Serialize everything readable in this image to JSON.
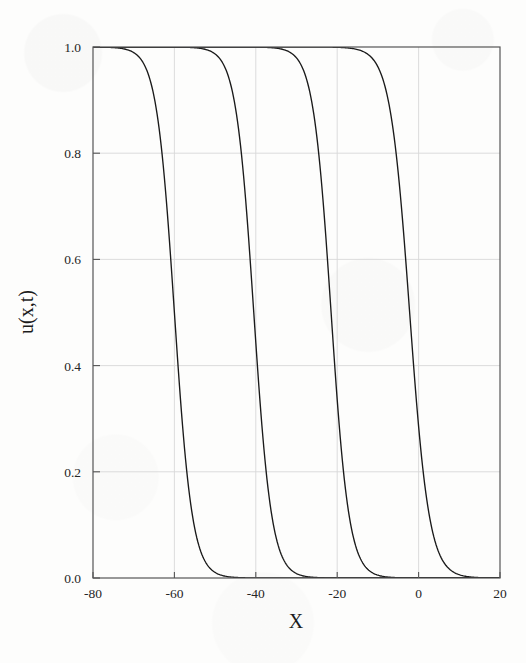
{
  "figure": {
    "background_color": "#fdfdfc",
    "frame_color": "#555555",
    "grid_color": "#d8d8d8",
    "curve_color": "#1a1a1a"
  },
  "axes": {
    "x_title": "X",
    "y_title": "u(x,t)",
    "x_ticks": [
      "-80",
      "-60",
      "-40",
      "-20",
      "0",
      "20"
    ],
    "y_ticks": [
      "0.0",
      "0.2",
      "0.4",
      "0.6",
      "0.8",
      "1.0"
    ]
  },
  "chart_data": {
    "type": "line",
    "title": "",
    "subtitle": "",
    "xlabel": "X",
    "ylabel": "u(x,t)",
    "xlim": [
      -80,
      20
    ],
    "ylim": [
      0.0,
      1.0
    ],
    "xticks": [
      -80,
      -60,
      -40,
      -20,
      0,
      20
    ],
    "yticks": [
      0.0,
      0.2,
      0.4,
      0.6,
      0.8,
      1.0
    ],
    "grid": true,
    "legend": "none",
    "annotations": [],
    "series": [
      {
        "name": "front-1",
        "front_center": -60,
        "front_width": 2.2,
        "x": [
          -80,
          -75,
          -70,
          -66,
          -64,
          -63,
          -62,
          -61.5,
          -61,
          -60.5,
          -60,
          -59.5,
          -59,
          -58.5,
          -58,
          -57,
          -56,
          -55,
          -54,
          -52,
          -50,
          -45,
          -40,
          -30,
          -20,
          -10,
          0,
          10,
          20
        ],
        "y": [
          1.0,
          1.0,
          1.0,
          0.999,
          0.995,
          0.99,
          0.97,
          0.945,
          0.89,
          0.74,
          0.5,
          0.26,
          0.11,
          0.055,
          0.03,
          0.013,
          0.007,
          0.004,
          0.003,
          0.002,
          0.001,
          0.001,
          0.0,
          0.0,
          0.0,
          0.0,
          0.0,
          0.0,
          0.0
        ]
      },
      {
        "name": "front-2",
        "front_center": -40.5,
        "front_width": 2.2,
        "x": [
          -80,
          -70,
          -60,
          -55,
          -50,
          -46,
          -44.5,
          -43.5,
          -42.5,
          -42,
          -41.5,
          -41,
          -40.5,
          -40,
          -39.5,
          -39,
          -38.5,
          -38,
          -37,
          -36,
          -35,
          -34,
          -32,
          -30,
          -25,
          -20,
          -10,
          0,
          10,
          20
        ],
        "y": [
          1.0,
          1.0,
          1.0,
          1.0,
          1.0,
          0.999,
          0.995,
          0.99,
          0.97,
          0.945,
          0.89,
          0.74,
          0.5,
          0.26,
          0.11,
          0.055,
          0.03,
          0.018,
          0.008,
          0.005,
          0.003,
          0.002,
          0.001,
          0.001,
          0.0,
          0.0,
          0.0,
          0.0,
          0.0,
          0.0
        ]
      },
      {
        "name": "front-3",
        "front_center": -21.5,
        "front_width": 2.2,
        "x": [
          -80,
          -70,
          -60,
          -50,
          -40,
          -32,
          -28,
          -26,
          -25,
          -24,
          -23.5,
          -23,
          -22.5,
          -22,
          -21.5,
          -21,
          -20.5,
          -20,
          -19.5,
          -19,
          -18,
          -17,
          -16,
          -14,
          -12,
          -10,
          -5,
          0,
          10,
          20
        ],
        "y": [
          1.0,
          1.0,
          1.0,
          1.0,
          1.0,
          1.0,
          0.999,
          0.996,
          0.992,
          0.98,
          0.965,
          0.94,
          0.885,
          0.74,
          0.5,
          0.26,
          0.115,
          0.06,
          0.032,
          0.019,
          0.009,
          0.005,
          0.003,
          0.002,
          0.001,
          0.001,
          0.0,
          0.0,
          0.0,
          0.0
        ]
      },
      {
        "name": "front-4",
        "front_center": -2.2,
        "front_width": 2.4,
        "x": [
          -80,
          -70,
          -60,
          -50,
          -40,
          -30,
          -20,
          -12,
          -9,
          -7,
          -6,
          -5.5,
          -5,
          -4.5,
          -4,
          -3.5,
          -3,
          -2.5,
          -2,
          -1.5,
          -1,
          -0.5,
          0,
          0.5,
          1,
          2,
          3,
          4,
          6,
          8,
          12,
          16,
          20
        ],
        "y": [
          1.0,
          1.0,
          1.0,
          1.0,
          1.0,
          1.0,
          1.0,
          0.999,
          0.997,
          0.993,
          0.988,
          0.983,
          0.975,
          0.962,
          0.94,
          0.905,
          0.85,
          0.75,
          0.58,
          0.4,
          0.25,
          0.15,
          0.09,
          0.055,
          0.035,
          0.017,
          0.01,
          0.006,
          0.003,
          0.002,
          0.001,
          0.0,
          0.0
        ]
      }
    ]
  }
}
